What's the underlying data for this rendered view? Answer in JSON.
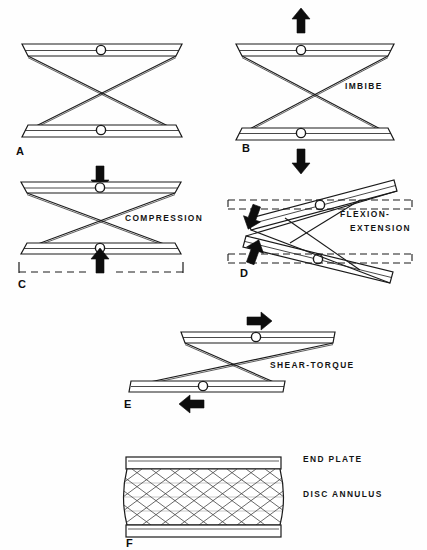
{
  "figure": {
    "line_color": "#1a1a1a",
    "arrow_color": "#0d0d0d",
    "background": "#ffffff",
    "plate_fill": "#ffffff"
  },
  "panels": [
    {
      "letter": "A",
      "label": "",
      "condition": "neutral",
      "description": "Two parallel end plates joined by crossing annulus fibers at rest"
    },
    {
      "letter": "B",
      "label": "IMBIBE",
      "condition": "distraction",
      "description": "Plates pulled apart, fibers tensioned, disc imbibes fluid",
      "arrows": [
        "up",
        "down"
      ]
    },
    {
      "letter": "C",
      "label": "COMPRESSION",
      "condition": "compression",
      "description": "Plates pressed together, annulus bulges outward",
      "arrows": [
        "down",
        "up"
      ],
      "bulge_marker": "dashed-bracket"
    },
    {
      "letter": "D",
      "label": "FLEXION-EXTENSION",
      "label_line_1": "FLEXION-",
      "label_line_2": "EXTENSION",
      "condition": "flexion-extension",
      "description": "Plates tilt into a wedge, one side compressed one side distracted",
      "arrows": [
        "down-left",
        "up-right"
      ],
      "reference_marker": "dashed-line"
    },
    {
      "letter": "E",
      "label": "SHEAR-TORQUE",
      "condition": "shear-torque",
      "description": "Plates displaced horizontally in opposite directions",
      "arrows": [
        "right",
        "left"
      ]
    },
    {
      "letter": "F",
      "label": "",
      "condition": "structure",
      "description": "Complete disc unit showing lattice annulus between end plates",
      "callouts": [
        {
          "text": "END PLATE",
          "target": "upper-plate"
        },
        {
          "text": "DISC ANNULUS",
          "target": "lattice-body"
        }
      ]
    }
  ],
  "labels": {
    "imbibe": "IMBIBE",
    "compression": "COMPRESSION",
    "flexion": "FLEXION-",
    "extension": "EXTENSION",
    "shear_torque": "SHEAR-TORQUE",
    "end_plate": "END PLATE",
    "disc_annulus": "DISC ANNULUS",
    "a": "A",
    "b": "B",
    "c": "C",
    "d": "D",
    "e": "E",
    "f": "F"
  }
}
